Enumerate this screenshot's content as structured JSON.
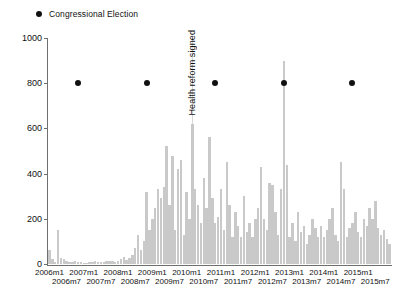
{
  "legend": {
    "marker": "election-dot",
    "label": "Congressional Election"
  },
  "chart_data": {
    "type": "bar",
    "title": "",
    "xlabel": "",
    "ylabel": "",
    "ylim": [
      0,
      1000
    ],
    "yticks": [
      0,
      200,
      400,
      600,
      800,
      1000
    ],
    "grid": false,
    "legend_position": "top-left",
    "bar_color": "#c9c9c9",
    "x_start": "2006m1",
    "x_end": "2015m12",
    "x_tick_labels_row1": [
      "2006m1",
      "2007m1",
      "2008m1",
      "2009m1",
      "2010m1",
      "2011m1",
      "2012m1",
      "2013m1",
      "2014m1",
      "2015m1"
    ],
    "x_tick_labels_row2": [
      "2006m7",
      "2007m7",
      "2008m7",
      "2009m7",
      "2010m7",
      "2011m7",
      "2012m7",
      "2013m7",
      "2014m7",
      "2015m7"
    ],
    "annotations": [
      {
        "name": "health-reform-line",
        "label": "Health reform signed",
        "x": "2010m3",
        "value": 800
      }
    ],
    "markers": [
      {
        "name": "congressional-election",
        "x": "2006m11",
        "y": 800
      },
      {
        "name": "congressional-election",
        "x": "2008m11",
        "y": 800
      },
      {
        "name": "congressional-election",
        "x": "2010m11",
        "y": 800
      },
      {
        "name": "congressional-election",
        "x": "2012m11",
        "y": 800
      },
      {
        "name": "congressional-election",
        "x": "2014m11",
        "y": 800
      }
    ],
    "categories": [
      "2006m1",
      "2006m2",
      "2006m3",
      "2006m4",
      "2006m5",
      "2006m6",
      "2006m7",
      "2006m8",
      "2006m9",
      "2006m10",
      "2006m11",
      "2006m12",
      "2007m1",
      "2007m2",
      "2007m3",
      "2007m4",
      "2007m5",
      "2007m6",
      "2007m7",
      "2007m8",
      "2007m9",
      "2007m10",
      "2007m11",
      "2007m12",
      "2008m1",
      "2008m2",
      "2008m3",
      "2008m4",
      "2008m5",
      "2008m6",
      "2008m7",
      "2008m8",
      "2008m9",
      "2008m10",
      "2008m11",
      "2008m12",
      "2009m1",
      "2009m2",
      "2009m3",
      "2009m4",
      "2009m5",
      "2009m6",
      "2009m7",
      "2009m8",
      "2009m9",
      "2009m10",
      "2009m11",
      "2009m12",
      "2010m1",
      "2010m2",
      "2010m3",
      "2010m4",
      "2010m5",
      "2010m6",
      "2010m7",
      "2010m8",
      "2010m9",
      "2010m10",
      "2010m11",
      "2010m12",
      "2011m1",
      "2011m2",
      "2011m3",
      "2011m4",
      "2011m5",
      "2011m6",
      "2011m7",
      "2011m8",
      "2011m9",
      "2011m10",
      "2011m11",
      "2011m12",
      "2012m1",
      "2012m2",
      "2012m3",
      "2012m4",
      "2012m5",
      "2012m6",
      "2012m7",
      "2012m8",
      "2012m9",
      "2012m10",
      "2012m11",
      "2012m12",
      "2013m1",
      "2013m2",
      "2013m3",
      "2013m4",
      "2013m5",
      "2013m6",
      "2013m7",
      "2013m8",
      "2013m9",
      "2013m10",
      "2013m11",
      "2013m12",
      "2014m1",
      "2014m2",
      "2014m3",
      "2014m4",
      "2014m5",
      "2014m6",
      "2014m7",
      "2014m8",
      "2014m9",
      "2014m10",
      "2014m11",
      "2014m12",
      "2015m1",
      "2015m2",
      "2015m3",
      "2015m4",
      "2015m5",
      "2015m6",
      "2015m7",
      "2015m8",
      "2015m9",
      "2015m10",
      "2015m11",
      "2015m12"
    ],
    "values": [
      60,
      20,
      10,
      150,
      25,
      20,
      15,
      10,
      8,
      12,
      10,
      8,
      6,
      5,
      8,
      10,
      12,
      10,
      8,
      10,
      12,
      14,
      12,
      10,
      14,
      20,
      30,
      18,
      25,
      40,
      70,
      130,
      60,
      100,
      320,
      150,
      200,
      250,
      330,
      290,
      340,
      520,
      260,
      480,
      150,
      420,
      460,
      130,
      320,
      200,
      620,
      330,
      260,
      180,
      380,
      250,
      560,
      290,
      180,
      210,
      330,
      150,
      450,
      260,
      120,
      230,
      170,
      120,
      300,
      140,
      180,
      120,
      200,
      250,
      430,
      200,
      150,
      360,
      350,
      230,
      130,
      330,
      900,
      440,
      120,
      180,
      100,
      230,
      140,
      170,
      90,
      130,
      200,
      160,
      120,
      170,
      120,
      150,
      200,
      250,
      130,
      100,
      450,
      330,
      120,
      160,
      180,
      230,
      140,
      120,
      200,
      170,
      250,
      200,
      280,
      160,
      130,
      150,
      110,
      90
    ]
  }
}
